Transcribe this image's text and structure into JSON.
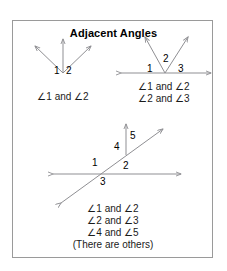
{
  "panel": {
    "title": "Adjacent Angles",
    "border_color": "#9a9a9a",
    "background_color": "#ffffff",
    "line_color": "#8f8f93",
    "text_color": "#1a1a1a"
  },
  "figures": [
    {
      "id": "figure-two-rays",
      "name": "three-rays-from-vertex",
      "angle_labels": [
        "1",
        "2"
      ],
      "caption_lines": [
        "∠1 and ∠2"
      ]
    },
    {
      "id": "figure-line-with-two-rays",
      "name": "two-rays-on-line",
      "angle_labels": [
        "1",
        "2",
        "3"
      ],
      "caption_lines": [
        "∠1 and ∠2",
        "∠2 and ∠3"
      ]
    },
    {
      "id": "figure-transversal",
      "name": "transversal-with-ray",
      "angle_labels": [
        "1",
        "2",
        "3",
        "4",
        "5"
      ],
      "caption_lines": [
        "∠1 and ∠2",
        "∠2 and ∠3",
        "∠4 and ∠5",
        "(There are others)"
      ]
    }
  ]
}
